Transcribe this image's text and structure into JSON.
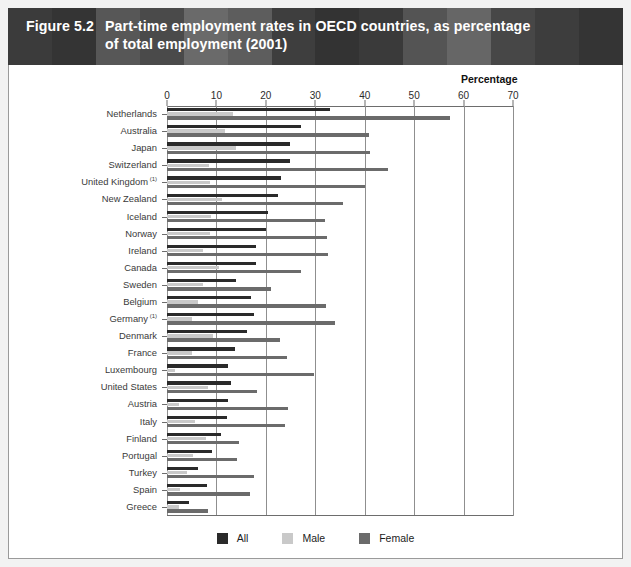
{
  "figure": {
    "number": "Figure 5.2",
    "title_line1": "Part-time employment rates in OECD countries, as percentage",
    "title_line2": "of total employment (2001)"
  },
  "axis": {
    "percentage_caption": "Percentage"
  },
  "legend": {
    "items": [
      {
        "label": "All",
        "color": "#2a2a2a",
        "swatch_name": "legend-swatch-all"
      },
      {
        "label": "Male",
        "color": "#c9c9c9",
        "swatch_name": "legend-swatch-male"
      },
      {
        "label": "Female",
        "color": "#6b6b6b",
        "swatch_name": "legend-swatch-female"
      }
    ]
  },
  "colors": {
    "header_background": "#2b2b2b",
    "header_text": "#ffffff",
    "panel_background": "#ffffff",
    "page_background": "#f2f2f2",
    "gridline": "#8f8f8f",
    "all_series": "#2a2a2a",
    "male_series": "#c9c9c9",
    "female_series": "#6b6b6b"
  },
  "chart_data": {
    "type": "bar",
    "orientation": "horizontal",
    "xlabel": "Percentage",
    "ylabel": "",
    "xlim": [
      0,
      70
    ],
    "xticks": [
      0,
      10,
      20,
      30,
      40,
      50,
      60,
      70
    ],
    "grid": true,
    "legend_position": "bottom-center",
    "categories": [
      "Netherlands",
      "Australia",
      "Japan",
      "Switzerland",
      "United Kingdom",
      "New Zealand",
      "Iceland",
      "Norway",
      "Ireland",
      "Canada",
      "Sweden",
      "Belgium",
      "Germany",
      "Denmark",
      "France",
      "Luxembourg",
      "United States",
      "Austria",
      "Italy",
      "Finland",
      "Portugal",
      "Turkey",
      "Spain",
      "Greece"
    ],
    "category_footnotes": {
      "United Kingdom": "(1)",
      "Germany": "(1)"
    },
    "series": [
      {
        "name": "All",
        "color": "#2a2a2a",
        "values": [
          33.0,
          27.2,
          24.9,
          24.8,
          23.0,
          22.4,
          20.4,
          20.1,
          18.1,
          18.1,
          13.9,
          17.0,
          17.6,
          16.2,
          13.8,
          12.4,
          13.0,
          12.4,
          12.2,
          11.0,
          9.2,
          6.2,
          8.0,
          4.5
        ]
      },
      {
        "name": "Male",
        "color": "#c9c9c9",
        "values": [
          13.4,
          11.8,
          14.0,
          8.4,
          8.8,
          11.2,
          9.0,
          8.7,
          7.2,
          10.5,
          7.3,
          6.3,
          5.0,
          9.4,
          5.1,
          1.7,
          8.2,
          2.4,
          5.6,
          7.8,
          5.3,
          4.1,
          2.6,
          2.5
        ]
      },
      {
        "name": "Female",
        "color": "#6b6b6b",
        "values": [
          57.2,
          40.8,
          41.0,
          44.7,
          40.0,
          35.6,
          32.0,
          32.4,
          32.5,
          27.1,
          21.0,
          32.2,
          33.9,
          22.9,
          24.3,
          29.8,
          18.2,
          24.5,
          23.9,
          14.5,
          14.2,
          17.6,
          16.8,
          8.2
        ]
      }
    ]
  }
}
